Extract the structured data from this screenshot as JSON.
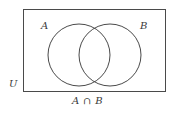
{
  "figure": {
    "type": "venn-diagram",
    "background_color": "#ffffff",
    "stroke_color": "#4a4a4a",
    "text_color": "#3a3a3a",
    "stroke_width": 1
  },
  "universe": {
    "label": "U",
    "shape": "rectangle",
    "x": 23,
    "y": 9,
    "width": 143,
    "height": 83
  },
  "sets": [
    {
      "label": "A",
      "shape": "circle",
      "cx": 79,
      "cy": 55,
      "r": 31,
      "fill": "none"
    },
    {
      "label": "B",
      "shape": "circle",
      "cx": 110,
      "cy": 55,
      "r": 31,
      "fill": "none"
    }
  ],
  "caption": {
    "text": "A ∩ B",
    "meaning": "intersection-of-a-and-b"
  }
}
